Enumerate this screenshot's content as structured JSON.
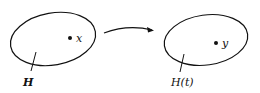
{
  "diagram": {
    "left_set": {
      "label": "H",
      "point_label": "x"
    },
    "right_set": {
      "label": "H(t)",
      "point_label": "y"
    },
    "arrow": {
      "direction": "left-to-right"
    },
    "colors": {
      "stroke": "#111111",
      "background": "#ffffff"
    }
  }
}
